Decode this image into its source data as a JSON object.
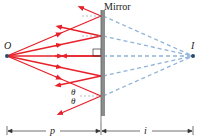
{
  "diagram": {
    "mirror_label": "Mirror",
    "object_label": "O",
    "image_label": "I",
    "angle_label_top": "θ",
    "angle_label_bottom": "θ",
    "object_distance_label": "p",
    "image_distance_label": "i",
    "colors": {
      "ray": "#e8202a",
      "virtual_ray": "#8fb3d9",
      "mirror": "#8a8c8e",
      "mirror_edge": "#5f6163",
      "point": "#2a4a6a",
      "dimension": "#333333",
      "text": "#222222"
    },
    "points": {
      "object": {
        "x": 7,
        "y": 56
      },
      "image": {
        "x": 193,
        "y": 56
      }
    },
    "mirror": {
      "x": 102,
      "y_top": 10,
      "y_bottom": 116
    },
    "ray_hits_y": [
      16,
      36,
      56,
      76,
      96
    ]
  }
}
